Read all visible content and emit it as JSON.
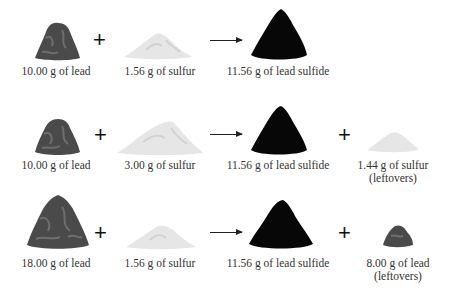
{
  "reactions": [
    {
      "reactants": [
        {
          "label": "10.00 g of lead",
          "substance": "lead"
        },
        {
          "label": "1.56 g of sulfur",
          "substance": "sulfur"
        }
      ],
      "products": [
        {
          "label": "11.56 g of lead sulfide",
          "substance": "lead-sulfide"
        }
      ],
      "leftover": null
    },
    {
      "reactants": [
        {
          "label": "10.00 g of lead",
          "substance": "lead"
        },
        {
          "label": "3.00 g of sulfur",
          "substance": "sulfur"
        }
      ],
      "products": [
        {
          "label": "11.56 g of lead sulfide",
          "substance": "lead-sulfide"
        }
      ],
      "leftover": {
        "label": "1.44 g of sulfur",
        "note": "(leftovers)",
        "substance": "sulfur"
      }
    },
    {
      "reactants": [
        {
          "label": "18.00 g of lead",
          "substance": "lead"
        },
        {
          "label": "1.56 g of sulfur",
          "substance": "sulfur"
        }
      ],
      "products": [
        {
          "label": "11.56 g of lead sulfide",
          "substance": "lead-sulfide"
        }
      ],
      "leftover": {
        "label": "8.00 g of lead",
        "note": "(leftovers)",
        "substance": "lead"
      }
    }
  ],
  "symbols": {
    "plus": "+"
  },
  "colors": {
    "lead": "#4a4a4a",
    "lead_highlight": "#6e6e6e",
    "sulfur": "#e6e6e6",
    "sulfur_shade": "#d2d2d2",
    "lead_sulfide": "#070707"
  }
}
